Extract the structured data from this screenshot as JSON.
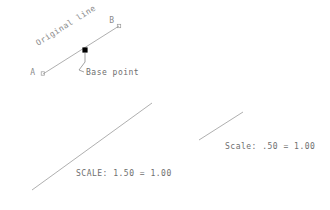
{
  "diagram": {
    "title_text": "Original line",
    "background_color": "#ffffff",
    "line_color": "#9a9a9a",
    "text_color": "#8a8a8a",
    "marker_color": "#000000",
    "original_line": {
      "label_a": "A",
      "label_b": "B",
      "annotation": "Original line",
      "base_point_label": "Base point",
      "start": {
        "x": 43,
        "y": 74
      },
      "end": {
        "x": 119,
        "y": 26
      },
      "base_point": {
        "x": 85,
        "y": 50
      },
      "annotation_angle_deg": -32
    },
    "scaled_up": {
      "scale_label": "SCALE: 1.50 = 1.00",
      "start": {
        "x": 32,
        "y": 190
      },
      "end": {
        "x": 152,
        "y": 103
      }
    },
    "scaled_down": {
      "scale_label": "Scale: .50 = 1.00",
      "start": {
        "x": 199,
        "y": 140
      },
      "end": {
        "x": 243,
        "y": 112
      }
    },
    "markers": {
      "endpoint_marker_shape": "small-square",
      "base_point_marker_shape": "filled-square"
    }
  }
}
